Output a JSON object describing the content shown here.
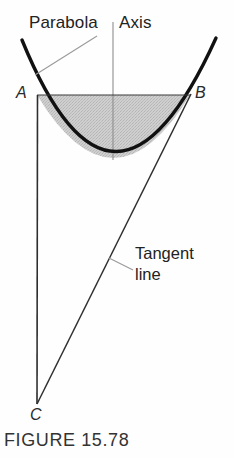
{
  "figure": {
    "caption": "FIGURE 15.78",
    "background_color": "#fefefe",
    "curve_color": "#111111",
    "line_color": "#333333",
    "shade_color": "#c8c8c8",
    "labels": {
      "parabola": "Parabola",
      "axis": "Axis",
      "tangent": "Tangent\nline",
      "point_a": "A",
      "point_b": "B",
      "point_c": "C"
    },
    "geometry": {
      "parabola_vertex": [
        113,
        158
      ],
      "chord_left": [
        37,
        95
      ],
      "chord_right": [
        190,
        95
      ],
      "apex_c": [
        37,
        404
      ],
      "axis_line": [
        [
          113,
          22
        ],
        [
          113,
          158
        ]
      ],
      "parabola_left_top": [
        22,
        40
      ],
      "parabola_right_top": [
        216,
        38
      ],
      "shaded_region": "chord AB down to parabola arc"
    }
  }
}
